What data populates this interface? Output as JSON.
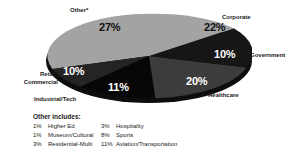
{
  "chart_data": {
    "type": "pie",
    "title": "",
    "subtitle": "",
    "xlabel": "",
    "ylabel": "",
    "legend_position": "outside-labels",
    "grid": false,
    "unit": "%",
    "categories": [
      "Other*",
      "Corporate",
      "Government",
      "Healthcare",
      "Industrial/Tech",
      "Retail/ Commercial"
    ],
    "values": [
      27,
      22,
      10,
      20,
      11,
      10
    ],
    "slices": [
      {
        "label": "Other*",
        "value": 27,
        "value_text": "27%",
        "color": "#a3a3a3",
        "label_on_dark": false
      },
      {
        "label": "Corporate",
        "value": 22,
        "value_text": "22%",
        "color": "#a3a3a3",
        "label_on_dark": false
      },
      {
        "label": "Government",
        "value": 10,
        "value_text": "10%",
        "color": "#161616",
        "label_on_dark": true
      },
      {
        "label": "Healthcare",
        "value": 20,
        "value_text": "20%",
        "color": "#3c3c3c",
        "label_on_dark": true
      },
      {
        "label": "Industrial/Tech",
        "value": 11,
        "value_text": "11%",
        "color": "#070707",
        "label_on_dark": true
      },
      {
        "label": "Retail/ Commercial",
        "value": 10,
        "value_text": "10%",
        "color": "#242424",
        "label_on_dark": true
      }
    ],
    "footnote": {
      "title": "Other includes:",
      "items": [
        {
          "percent": "1%",
          "label": "Higher Ed"
        },
        {
          "percent": "3%",
          "label": "Hospitality"
        },
        {
          "percent": "1%",
          "label": "Museum/Cultural"
        },
        {
          "percent": "8%",
          "label": "Sports"
        },
        {
          "percent": "3%",
          "label": "Residential-Multi"
        },
        {
          "percent": "11%",
          "label": "Aviation/Transportation"
        }
      ]
    }
  },
  "labels": {
    "other": "Other*",
    "corporate": "Corporate",
    "government": "Government",
    "healthcare": "Healthcare",
    "industrial": "Industrial/Tech",
    "retail_line1": "Retail/",
    "retail_line2": "Commercial"
  },
  "percents": {
    "other": "27%",
    "corporate": "22%",
    "government": "10%",
    "healthcare": "20%",
    "industrial": "11%",
    "retail": "10%"
  },
  "footnote": {
    "title": "Other includes:",
    "rows": [
      {
        "a_pct": "1%",
        "a_label": "Higher Ed",
        "b_pct": "3%",
        "b_label": "Hospitality"
      },
      {
        "a_pct": "1%",
        "a_label": "Museum/Cultural",
        "b_pct": "8%",
        "b_label": "Sports"
      },
      {
        "a_pct": "3%",
        "a_label": "Residential-Multi",
        "b_pct": "11%",
        "b_label": "Aviation/Transportation"
      }
    ]
  },
  "colors": {
    "light_gray": "#a3a3a3",
    "mid_gray": "#3c3c3c",
    "dark_gray": "#242424",
    "near_black": "#161616",
    "black": "#070707",
    "side_wall": "#0d0d0d",
    "text": "#1a1a1a"
  }
}
